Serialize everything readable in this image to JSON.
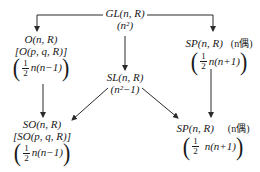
{
  "diagram": {
    "nodes": {
      "gl": {
        "label": "GL(n, R)",
        "dim": "(n²)"
      },
      "o": {
        "label": "O(n, R)",
        "alt": "[O(p, q, R)]",
        "frac_num": "1",
        "frac_den": "2",
        "expr": "n(n−1)"
      },
      "sp_top": {
        "label": "SP(n, R)",
        "note": "(n偶)",
        "frac_num": "1",
        "frac_den": "2",
        "expr": "n(n+1)"
      },
      "sl": {
        "label": "SL(n, R)",
        "dim": "(n²−1)"
      },
      "so": {
        "label": "SO(n, R)",
        "alt": "[SO(p, q, R)]",
        "frac_num": "1",
        "frac_den": "2",
        "expr": "n(n−1)"
      },
      "sp_bottom": {
        "label": "SP(n, R)",
        "note": "(n偶)",
        "frac_num": "1",
        "frac_den": "2",
        "expr": "n(n+1)"
      }
    },
    "edges": [
      {
        "from": "gl",
        "to": "o"
      },
      {
        "from": "gl",
        "to": "sp_top"
      },
      {
        "from": "gl",
        "to": "sl"
      },
      {
        "from": "o",
        "to": "so"
      },
      {
        "from": "sl",
        "to": "so"
      },
      {
        "from": "sl",
        "to": "sp_bottom"
      },
      {
        "from": "sp_top",
        "to": "sp_bottom"
      }
    ],
    "colors": {
      "line": "#2a2a2a",
      "text": "#1a1a1a",
      "background": "#ffffff"
    }
  }
}
